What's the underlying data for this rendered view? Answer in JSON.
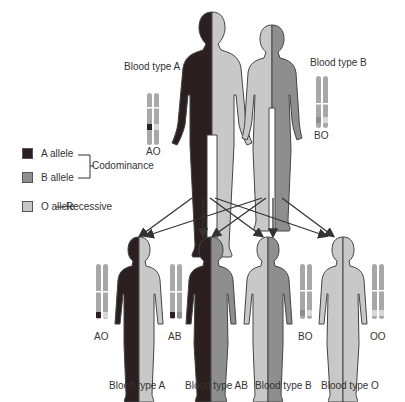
{
  "colors": {
    "a_allele": "#2b1f1f",
    "b_allele": "#8e8e8e",
    "o_allele": "#c8c8c8",
    "outline": "#444444",
    "chromosome": "#a8a8a8"
  },
  "legend": {
    "items": [
      {
        "label": "A allele",
        "color": "#2b1f1f"
      },
      {
        "label": "B allele",
        "color": "#8e8e8e"
      },
      {
        "label": "O allele",
        "color": "#c8c8c8"
      }
    ],
    "codominance_label": "Codominance",
    "recessive_label": "Recessive"
  },
  "parents": [
    {
      "role": "father",
      "blood_type_label": "Blood type A",
      "genotype": "AO",
      "left_color": "#2b1f1f",
      "right_color": "#c8c8c8"
    },
    {
      "role": "mother",
      "blood_type_label": "Blood type B",
      "genotype": "BO",
      "left_color": "#c8c8c8",
      "right_color": "#8e8e8e"
    }
  ],
  "children": [
    {
      "blood_type_label": "Blood type A",
      "genotype": "AO",
      "left_color": "#2b1f1f",
      "right_color": "#c8c8c8"
    },
    {
      "blood_type_label": "Blood type AB",
      "genotype": "AB",
      "left_color": "#2b1f1f",
      "right_color": "#8e8e8e"
    },
    {
      "blood_type_label": "Blood type B",
      "genotype": "BO",
      "left_color": "#c8c8c8",
      "right_color": "#8e8e8e"
    },
    {
      "blood_type_label": "Blood type O",
      "genotype": "OO",
      "left_color": "#c8c8c8",
      "right_color": "#c8c8c8"
    }
  ]
}
